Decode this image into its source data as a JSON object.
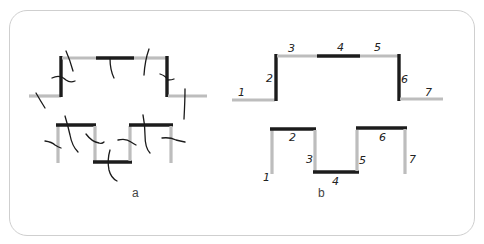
{
  "figure": {
    "panels": [
      {
        "id": "a",
        "label": "a",
        "description": "Two segmented paths, each segment crossed by a short hand-drawn tick mark",
        "top_path": {
          "segments": [
            {
              "index": 1,
              "orientation": "horizontal",
              "color": "gray"
            },
            {
              "index": 2,
              "orientation": "vertical",
              "color": "black"
            },
            {
              "index": 3,
              "orientation": "horizontal",
              "color": "gray"
            },
            {
              "index": 4,
              "orientation": "horizontal",
              "color": "black"
            },
            {
              "index": 5,
              "orientation": "horizontal",
              "color": "gray"
            },
            {
              "index": 6,
              "orientation": "vertical",
              "color": "black"
            },
            {
              "index": 7,
              "orientation": "horizontal",
              "color": "gray"
            }
          ]
        },
        "bottom_path": {
          "segments": [
            {
              "index": 1,
              "orientation": "vertical",
              "color": "gray"
            },
            {
              "index": 2,
              "orientation": "horizontal",
              "color": "black"
            },
            {
              "index": 3,
              "orientation": "vertical",
              "color": "gray"
            },
            {
              "index": 4,
              "orientation": "horizontal",
              "color": "black"
            },
            {
              "index": 5,
              "orientation": "vertical",
              "color": "gray"
            },
            {
              "index": 6,
              "orientation": "horizontal",
              "color": "black"
            },
            {
              "index": 7,
              "orientation": "vertical",
              "color": "gray"
            }
          ]
        }
      },
      {
        "id": "b",
        "label": "b",
        "description": "Same two paths with numbered segments 1-7",
        "top_path": {
          "segment_labels": [
            "1",
            "2",
            "3",
            "4",
            "5",
            "6",
            "7"
          ]
        },
        "bottom_path": {
          "segment_labels": [
            "1",
            "2",
            "3",
            "4",
            "5",
            "6",
            "7"
          ]
        }
      }
    ],
    "colors": {
      "gray_segment": "#bdbdbd",
      "black_segment": "#1c1c1c",
      "frame_border": "#cfcfcf",
      "background": "#ffffff"
    }
  }
}
